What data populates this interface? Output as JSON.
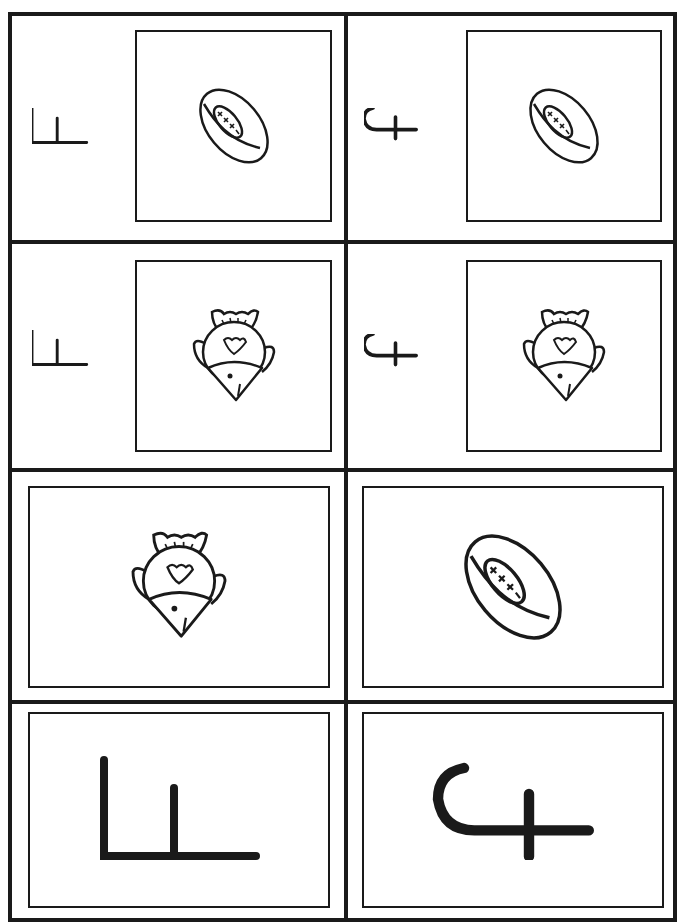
{
  "worksheet": {
    "title": "Letter F matching cards",
    "rows": [
      {
        "cells": [
          {
            "letter": "F",
            "letter_form": "uppercase-f-rotated",
            "picture": "football"
          },
          {
            "letter": "f",
            "letter_form": "lowercase-f-rotated",
            "picture": "football"
          }
        ]
      },
      {
        "cells": [
          {
            "letter": "F",
            "letter_form": "uppercase-f-rotated",
            "picture": "fish"
          },
          {
            "letter": "f",
            "letter_form": "lowercase-f-rotated",
            "picture": "fish"
          }
        ]
      },
      {
        "cells": [
          {
            "picture": "fish"
          },
          {
            "picture": "football"
          }
        ]
      },
      {
        "cells": [
          {
            "letter": "F",
            "letter_form": "uppercase-f-rotated"
          },
          {
            "letter": "f",
            "letter_form": "lowercase-f-rotated"
          }
        ]
      }
    ],
    "colors": {
      "ink": "#1a1a1a",
      "paper": "#ffffff"
    }
  }
}
